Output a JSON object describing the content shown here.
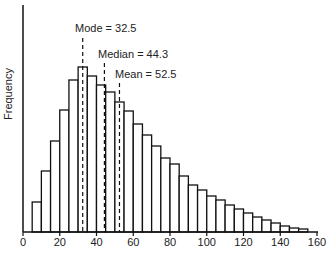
{
  "chart_data": {
    "type": "bar",
    "title": "",
    "xlabel": "",
    "ylabel": "Frequency",
    "xlim": [
      0,
      160
    ],
    "x_ticks": [
      0,
      20,
      40,
      60,
      80,
      100,
      120,
      140,
      160
    ],
    "y_ticks": [],
    "grid": false,
    "bin_width": 5,
    "bins_start": [
      5,
      10,
      15,
      20,
      25,
      30,
      35,
      40,
      45,
      50,
      55,
      60,
      65,
      70,
      75,
      80,
      85,
      90,
      95,
      100,
      105,
      110,
      115,
      120,
      125,
      130,
      135,
      140,
      145,
      150
    ],
    "values": [
      30,
      61,
      91,
      122,
      152,
      165,
      156,
      147,
      140,
      130,
      121,
      108,
      97,
      86,
      74,
      68,
      56,
      47,
      42,
      36,
      32,
      27,
      23,
      19,
      15,
      12,
      9,
      6,
      4,
      3
    ],
    "annotations": [
      {
        "label": "Mode = 32.5",
        "x": 32.5
      },
      {
        "label": "Median = 44.3",
        "x": 44.3
      },
      {
        "label": "Mean = 52.5",
        "x": 52.5
      }
    ]
  },
  "labels": {
    "ylabel": "Frequency",
    "mode": "Mode = 32.5",
    "median": "Median = 44.3",
    "mean": "Mean = 52.5"
  }
}
